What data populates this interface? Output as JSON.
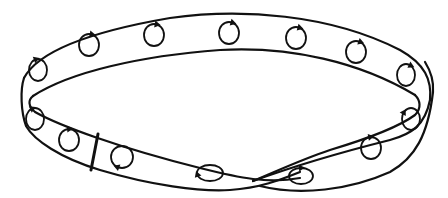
{
  "diagram": {
    "colors": {
      "ink": "#111111",
      "background": "#ffffff"
    },
    "orientation_markers": {
      "count": 17,
      "icon": "circular-arrow-icon"
    },
    "cut_line": {
      "present": true
    }
  }
}
